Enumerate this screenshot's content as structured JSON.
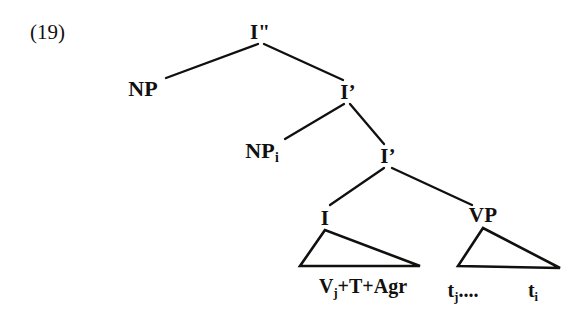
{
  "figure": {
    "example_number": "(19)",
    "ink_color": "#12100f",
    "background_color": "#ffffff"
  },
  "tree": {
    "nodes": {
      "root": {
        "label": "I\"",
        "x": 260,
        "y": 22,
        "font_size": 21
      },
      "np_spec": {
        "label": "NP",
        "x": 143,
        "y": 78,
        "font_size": 22
      },
      "i_bar_upper": {
        "label": "I’",
        "x": 348,
        "y": 82,
        "font_size": 21
      },
      "np_i": {
        "label": "NP",
        "subscript": "i",
        "x": 262,
        "y": 140,
        "font_size": 22
      },
      "i_bar_lower": {
        "label": "I’",
        "x": 388,
        "y": 146,
        "font_size": 21
      },
      "i_head": {
        "label": "I",
        "x": 325,
        "y": 208,
        "font_size": 21
      },
      "vp": {
        "label": "VP",
        "x": 483,
        "y": 205,
        "font_size": 21
      }
    },
    "leaves": {
      "i_head_content": {
        "label": "V",
        "subscript": "j",
        "rest": "+T+Agr",
        "x": 363,
        "y": 276,
        "font_size": 20
      },
      "trace_j": {
        "label": "t",
        "subscript": "j",
        "rest": "....",
        "x": 463,
        "y": 280,
        "font_size": 20
      },
      "trace_i": {
        "label": "t",
        "subscript": "i",
        "x": 533,
        "y": 280,
        "font_size": 20
      }
    },
    "edges": [
      {
        "name": "root-to-np-spec",
        "x1": 258,
        "y1": 44,
        "x2": 166,
        "y2": 78
      },
      {
        "name": "root-to-i-bar-upper",
        "x1": 264,
        "y1": 44,
        "x2": 343,
        "y2": 80
      },
      {
        "name": "i-bar-upper-to-np-i",
        "x1": 344,
        "y1": 104,
        "x2": 285,
        "y2": 139
      },
      {
        "name": "i-bar-upper-to-i-bar-lower",
        "x1": 350,
        "y1": 104,
        "x2": 384,
        "y2": 144
      },
      {
        "name": "i-bar-lower-to-i-head",
        "x1": 384,
        "y1": 168,
        "x2": 330,
        "y2": 205
      },
      {
        "name": "i-bar-lower-to-vp",
        "x1": 392,
        "y1": 168,
        "x2": 472,
        "y2": 205
      }
    ],
    "triangles": [
      {
        "name": "i-head-triangle",
        "apex_x": 325,
        "apex_y": 230,
        "left_x": 300,
        "left_y": 266,
        "right_x": 420,
        "right_y": 266
      },
      {
        "name": "vp-triangle",
        "apex_x": 483,
        "apex_y": 228,
        "left_x": 458,
        "left_y": 266,
        "right_x": 560,
        "right_y": 268
      }
    ]
  }
}
